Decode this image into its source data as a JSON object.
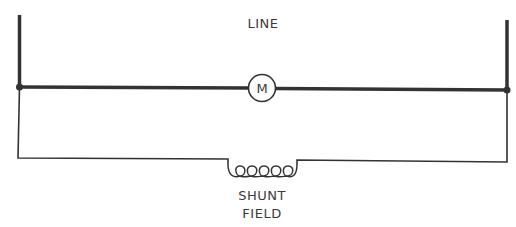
{
  "diagram": {
    "title_label": "LINE",
    "motor": {
      "symbol": "M"
    },
    "field": {
      "line1": "SHUNT",
      "line2": "FIELD"
    },
    "colors": {
      "stroke": "#333333",
      "background": "#ffffff"
    }
  }
}
